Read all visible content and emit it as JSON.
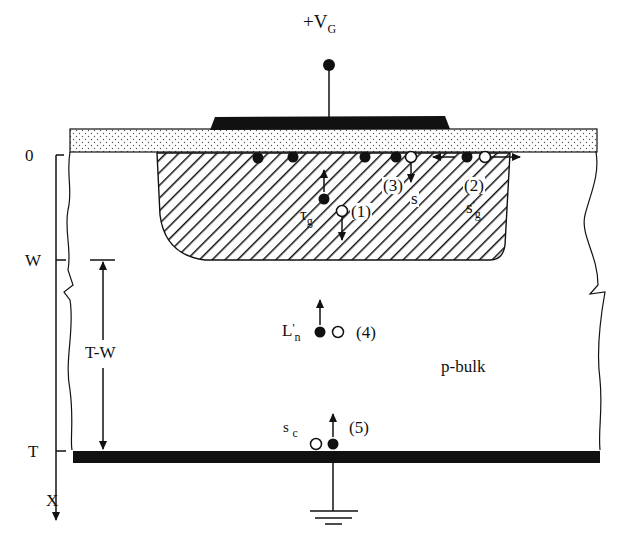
{
  "diagram": {
    "type": "MOS capacitor cross-section (deep depletion generation mechanisms)",
    "gate": {
      "label_prefix": "+V",
      "label_sub": "G"
    },
    "axis": {
      "ticks": [
        {
          "id": "zero",
          "label": "0"
        },
        {
          "id": "w",
          "label": "W"
        },
        {
          "id": "t",
          "label": "T"
        }
      ],
      "direction_label": "X"
    },
    "dimension": {
      "label": "T-W"
    },
    "region_labels": {
      "bulk": "p-bulk"
    },
    "mechanisms": [
      {
        "id": "1",
        "label": "(1)",
        "param_main": "τ",
        "param_sub": "g",
        "description": "bulk generation in depletion region"
      },
      {
        "id": "2",
        "label": "(2)",
        "param_main": "s",
        "param_prime": "'",
        "param_sub": "g",
        "description": "lateral surface generation"
      },
      {
        "id": "3",
        "label": "(3)",
        "param_main": "s",
        "description": "surface generation under gate"
      },
      {
        "id": "4",
        "label": "(4)",
        "param_main": "L",
        "param_prime": "'",
        "param_sub": "n",
        "description": "quasi-neutral bulk diffusion"
      },
      {
        "id": "5",
        "label": "(5)",
        "param_main": "s",
        "param_sub": "c",
        "description": "back contact generation"
      }
    ],
    "colors": {
      "ink": "#111111",
      "background": "#ffffff",
      "oxide_dots": "#555555"
    }
  }
}
